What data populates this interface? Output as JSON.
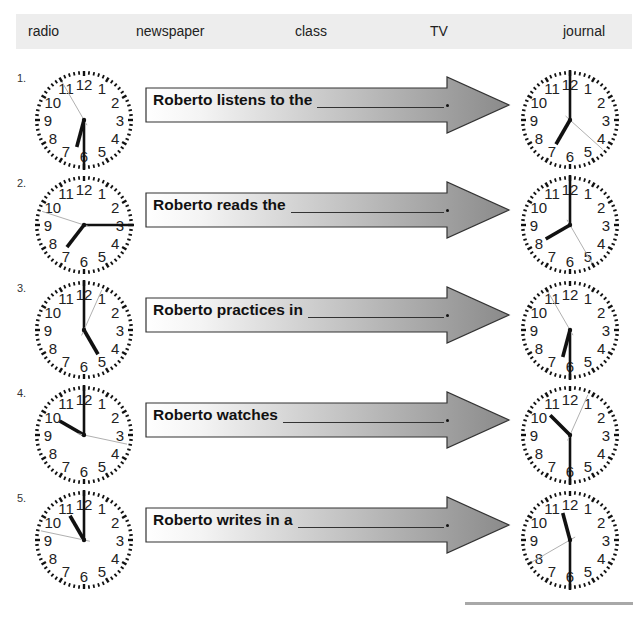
{
  "word_bank": {
    "words": [
      "radio",
      "newspaper",
      "class",
      "TV",
      "journal"
    ]
  },
  "exercises": [
    {
      "number": "1.",
      "sentence": "Roberto listens to the",
      "blank_end": ".",
      "start_clock": {
        "time": "6:30",
        "hour": 6,
        "minute": 30,
        "second": 55
      },
      "end_clock": {
        "time": "7:00",
        "hour": 7,
        "minute": 0,
        "second": 22
      }
    },
    {
      "number": "2.",
      "sentence": "Roberto reads the",
      "blank_end": ".",
      "start_clock": {
        "time": "7:15",
        "hour": 7,
        "minute": 15,
        "second": 48
      },
      "end_clock": {
        "time": "8:00",
        "hour": 8,
        "minute": 0,
        "second": 25
      }
    },
    {
      "number": "3.",
      "sentence": "Roberto practices in",
      "blank_end": ".",
      "start_clock": {
        "time": "5:00",
        "hour": 5,
        "minute": 0,
        "second": 4
      },
      "end_clock": {
        "time": "6:30",
        "hour": 6,
        "minute": 30,
        "second": 55
      }
    },
    {
      "number": "4.",
      "sentence": "Roberto watches",
      "blank_end": ".",
      "start_clock": {
        "time": "10:00",
        "hour": 10,
        "minute": 0,
        "second": 17
      },
      "end_clock": {
        "time": "10:30",
        "hour": 10,
        "minute": 30,
        "second": 4
      }
    },
    {
      "number": "5.",
      "sentence": "Roberto writes in a",
      "blank_end": ".",
      "start_clock": {
        "time": "11:00",
        "hour": 11,
        "minute": 0,
        "second": 47
      },
      "end_clock": {
        "time": "11:30",
        "hour": 11,
        "minute": 30,
        "second": 40
      }
    }
  ],
  "colors": {
    "word_bank_bg": "#ededed",
    "arrow_light": "#ffffff",
    "arrow_dark": "#8a8a8a",
    "second_hand": "#b0b0b0"
  }
}
